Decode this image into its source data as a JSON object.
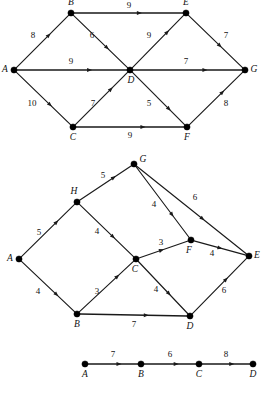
{
  "figure": {
    "type": "directed-weighted-graph-figure",
    "panel_count": 3,
    "colors": {
      "background": "#ffffff",
      "ink": "#1a1a1a",
      "node_fill": "#000000"
    }
  },
  "panels": [
    {
      "id": "graph-1",
      "name": "upper-graph",
      "nodes": [
        {
          "id": "A",
          "label": "A",
          "x": 14,
          "y": 70,
          "label_dx": -9,
          "label_dy": 0
        },
        {
          "id": "B",
          "label": "B",
          "x": 71,
          "y": 13,
          "label_dx": 0,
          "label_dy": -10
        },
        {
          "id": "C",
          "label": "C",
          "x": 73,
          "y": 127,
          "label_dx": 0,
          "label_dy": 11
        },
        {
          "id": "D",
          "label": "D",
          "x": 130,
          "y": 70,
          "label_dx": 1,
          "label_dy": 11
        },
        {
          "id": "E",
          "label": "E",
          "x": 186,
          "y": 13,
          "label_dx": 0,
          "label_dy": -10
        },
        {
          "id": "F",
          "label": "F",
          "x": 187,
          "y": 127,
          "label_dx": 0,
          "label_dy": 11
        },
        {
          "id": "G",
          "label": "G",
          "x": 245,
          "y": 70,
          "label_dx": 9,
          "label_dy": 0
        }
      ],
      "edges": [
        {
          "from": "A",
          "to": "B",
          "weight": "8",
          "wx": 33,
          "wy": 36,
          "arrow_t": 0.62,
          "thick": false
        },
        {
          "from": "A",
          "to": "D",
          "weight": "9",
          "wx": 71,
          "wy": 62,
          "arrow_t": 0.66,
          "thick": true
        },
        {
          "from": "A",
          "to": "C",
          "weight": "10",
          "wx": 32,
          "wy": 104,
          "arrow_t": 0.62,
          "thick": false
        },
        {
          "from": "B",
          "to": "E",
          "weight": "9",
          "wx": 129,
          "wy": 6,
          "arrow_t": 0.6,
          "thick": true
        },
        {
          "from": "B",
          "to": "D",
          "weight": "6",
          "wx": 92,
          "wy": 36,
          "arrow_t": 0.62,
          "thick": false
        },
        {
          "from": "C",
          "to": "D",
          "weight": "7",
          "wx": 93,
          "wy": 104,
          "arrow_t": 0.68,
          "thick": false
        },
        {
          "from": "C",
          "to": "F",
          "weight": "9",
          "wx": 130,
          "wy": 136,
          "arrow_t": 0.62,
          "thick": true
        },
        {
          "from": "D",
          "to": "E",
          "weight": "9",
          "wx": 149,
          "wy": 36,
          "arrow_t": 0.68,
          "thick": false
        },
        {
          "from": "D",
          "to": "G",
          "weight": "7",
          "wx": 186,
          "wy": 62,
          "arrow_t": 0.66,
          "thick": true
        },
        {
          "from": "D",
          "to": "F",
          "weight": "5",
          "wx": 149,
          "wy": 104,
          "arrow_t": 0.7,
          "thick": false
        },
        {
          "from": "E",
          "to": "G",
          "weight": "7",
          "wx": 226,
          "wy": 36,
          "arrow_t": 0.58,
          "thick": false
        },
        {
          "from": "F",
          "to": "G",
          "weight": "8",
          "wx": 226,
          "wy": 104,
          "arrow_t": 0.62,
          "thick": false
        }
      ]
    },
    {
      "id": "graph-2",
      "name": "middle-graph",
      "nodes": [
        {
          "id": "A",
          "label": "A",
          "x": 19,
          "y": 259,
          "label_dx": -9,
          "label_dy": 0
        },
        {
          "id": "B",
          "label": "B",
          "x": 77,
          "y": 314,
          "label_dx": 0,
          "label_dy": 11
        },
        {
          "id": "C",
          "label": "C",
          "x": 136,
          "y": 259,
          "label_dx": -1,
          "label_dy": 11
        },
        {
          "id": "D",
          "label": "D",
          "x": 190,
          "y": 316,
          "label_dx": 0,
          "label_dy": 11
        },
        {
          "id": "E",
          "label": "E",
          "x": 249,
          "y": 256,
          "label_dx": 8,
          "label_dy": 0
        },
        {
          "id": "F",
          "label": "F",
          "x": 191,
          "y": 240,
          "label_dx": -2,
          "label_dy": 11
        },
        {
          "id": "G",
          "label": "G",
          "x": 134,
          "y": 164,
          "label_dx": 9,
          "label_dy": -4
        },
        {
          "id": "H",
          "label": "H",
          "x": 77,
          "y": 202,
          "label_dx": -3,
          "label_dy": -10
        }
      ],
      "edges": [
        {
          "from": "A",
          "to": "H",
          "weight": "5",
          "wx": 39,
          "wy": 233,
          "arrow_t": 0.66,
          "thick": false
        },
        {
          "from": "A",
          "to": "B",
          "weight": "4",
          "wx": 38,
          "wy": 292,
          "arrow_t": 0.66,
          "thick": false
        },
        {
          "from": "H",
          "to": "G",
          "weight": "5",
          "wx": 103,
          "wy": 176,
          "arrow_t": 0.66,
          "thick": false
        },
        {
          "from": "H",
          "to": "C",
          "weight": "4",
          "wx": 97,
          "wy": 232,
          "arrow_t": 0.62,
          "thick": false
        },
        {
          "from": "B",
          "to": "C",
          "weight": "3",
          "wx": 97,
          "wy": 292,
          "arrow_t": 0.7,
          "thick": false
        },
        {
          "from": "B",
          "to": "D",
          "weight": "7",
          "wx": 134,
          "wy": 325,
          "arrow_t": 0.62,
          "thick": true
        },
        {
          "from": "C",
          "to": "F",
          "weight": "3",
          "wx": 161,
          "wy": 243,
          "arrow_t": 0.46,
          "thick": false
        },
        {
          "from": "C",
          "to": "D",
          "weight": "4",
          "wx": 156,
          "wy": 290,
          "arrow_t": 0.62,
          "thick": false
        },
        {
          "from": "G",
          "to": "F",
          "weight": "4",
          "wx": 154,
          "wy": 205,
          "arrow_t": 0.68,
          "thick": false
        },
        {
          "from": "G",
          "to": "E",
          "weight": "6",
          "wx": 195,
          "wy": 198,
          "arrow_t": 0.6,
          "thick": false
        },
        {
          "from": "F",
          "to": "E",
          "weight": "4",
          "wx": 212,
          "wy": 254,
          "arrow_t": 0.5,
          "thick": false
        },
        {
          "from": "D",
          "to": "E",
          "weight": "6",
          "wx": 224,
          "wy": 291,
          "arrow_t": 0.62,
          "thick": false
        }
      ]
    },
    {
      "id": "graph-3",
      "name": "lower-path-graph",
      "nodes": [
        {
          "id": "A",
          "label": "A",
          "x": 85,
          "y": 364,
          "label_dx": 0,
          "label_dy": 11
        },
        {
          "id": "B",
          "label": "B",
          "x": 141,
          "y": 364,
          "label_dx": 0,
          "label_dy": 11
        },
        {
          "id": "C",
          "label": "C",
          "x": 199,
          "y": 364,
          "label_dx": 0,
          "label_dy": 11
        },
        {
          "id": "D",
          "label": "D",
          "x": 253,
          "y": 364,
          "label_dx": 0,
          "label_dy": 11
        }
      ],
      "edges": [
        {
          "from": "A",
          "to": "B",
          "weight": "7",
          "wx": 113,
          "wy": 355,
          "arrow_t": 0.62,
          "thick": true
        },
        {
          "from": "B",
          "to": "C",
          "weight": "6",
          "wx": 170,
          "wy": 355,
          "arrow_t": 0.62,
          "thick": true
        },
        {
          "from": "C",
          "to": "D",
          "weight": "8",
          "wx": 226,
          "wy": 355,
          "arrow_t": 0.62,
          "thick": true
        }
      ]
    }
  ]
}
